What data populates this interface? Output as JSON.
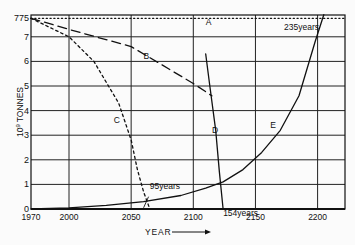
{
  "chart_data": {
    "type": "line",
    "title": "",
    "xlabel": "YEAR",
    "ylabel": "10^9 TONNES",
    "ylabel_prefix": "10",
    "ylabel_exp": "9",
    "ylabel_unit": "TONNES",
    "xlim": [
      1970,
      2222
    ],
    "ylim": [
      0,
      7.9
    ],
    "grid": true,
    "x_ticks": [
      1970,
      2000,
      2050,
      2100,
      2150,
      2200
    ],
    "x_tick_labels": [
      "1970",
      "2000",
      "2050",
      "2100",
      "2150",
      "2200"
    ],
    "y_ticks": [
      0,
      1,
      2,
      3,
      4,
      5,
      6,
      7,
      7.75
    ],
    "y_tick_labels": [
      "0",
      "1",
      "2",
      "3",
      "4",
      "5",
      "6",
      "7",
      "775"
    ],
    "series": [
      {
        "name": "A",
        "style": "dotted",
        "x": [
          1970,
          2222
        ],
        "y": [
          7.75,
          7.75
        ]
      },
      {
        "name": "B",
        "style": "dashed",
        "x": [
          1970,
          2000,
          2050,
          2100,
          2115
        ],
        "y": [
          7.75,
          7.3,
          6.6,
          5.1,
          4.6
        ]
      },
      {
        "name": "C",
        "style": "dotted-dash",
        "x": [
          1970,
          2000,
          2020,
          2040,
          2050,
          2055,
          2060,
          2065
        ],
        "y": [
          7.75,
          7.0,
          6.0,
          4.3,
          2.8,
          1.6,
          0.7,
          0.0
        ]
      },
      {
        "name": "D",
        "style": "solid",
        "x": [
          2110,
          2113,
          2118,
          2121,
          2124
        ],
        "y": [
          6.3,
          5.1,
          3.2,
          1.5,
          0.0
        ]
      },
      {
        "name": "E",
        "style": "solid",
        "x": [
          1970,
          2000,
          2030,
          2060,
          2090,
          2110,
          2124,
          2140,
          2155,
          2170,
          2185,
          2198,
          2205
        ],
        "y": [
          0.0,
          0.05,
          0.15,
          0.3,
          0.55,
          0.85,
          1.1,
          1.6,
          2.3,
          3.2,
          4.6,
          6.8,
          7.9
        ]
      }
    ],
    "annotations": [
      {
        "text": "A",
        "x": 2110,
        "y": 7.6
      },
      {
        "text": "B",
        "x": 2060,
        "y": 6.2
      },
      {
        "text": "C",
        "x": 2036,
        "y": 3.6
      },
      {
        "text": "D",
        "x": 2115,
        "y": 3.2
      },
      {
        "text": "E",
        "x": 2162,
        "y": 3.4
      },
      {
        "text": "95years",
        "x": 2065,
        "y": 0.95
      },
      {
        "text": "154years",
        "x": 2124,
        "y": -0.15
      },
      {
        "text": "235years",
        "x": 2173,
        "y": 7.4
      }
    ],
    "x_axis_arrow": true
  }
}
